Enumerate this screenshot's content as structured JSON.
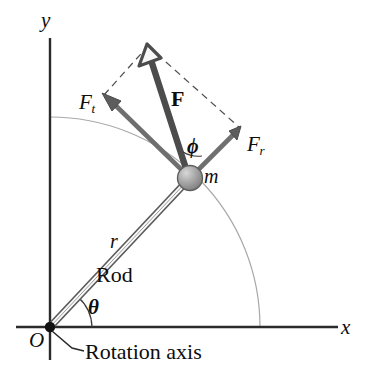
{
  "figure": {
    "background_color": "#ffffff",
    "width": 368,
    "height": 370
  },
  "axes": {
    "x_label": "x",
    "y_label": "y",
    "origin_label": "O",
    "axis_color": "#2b2b2b",
    "origin": {
      "x": 50,
      "y": 327
    },
    "x_end": {
      "x": 338,
      "y": 327
    },
    "y_top": {
      "x": 50,
      "y": 38
    }
  },
  "rod": {
    "label": "Rod",
    "length_label": "r",
    "angle_label": "θ",
    "color": "#4a4a4a",
    "start": {
      "x": 50,
      "y": 327
    },
    "end": {
      "x": 190,
      "y": 178
    }
  },
  "mass": {
    "label": "m",
    "center": {
      "x": 190,
      "y": 178
    },
    "radius": 12,
    "fill_color": "#9a9a9a"
  },
  "arc_path": {
    "color": "#9e9e9e",
    "radius": 210,
    "description": "circular path of the particle"
  },
  "vectors": [
    {
      "name": "F",
      "label": "F",
      "bold": true,
      "color": "#4a4a4a",
      "tail": {
        "x": 190,
        "y": 178
      },
      "tip": {
        "x": 148,
        "y": 46
      }
    },
    {
      "name": "F_t",
      "label": "F",
      "subscript": "t",
      "color": "#6e6e6e",
      "tail": {
        "x": 190,
        "y": 178
      },
      "tip": {
        "x": 104,
        "y": 95
      }
    },
    {
      "name": "F_r",
      "label": "F",
      "subscript": "r",
      "color": "#6e6e6e",
      "tail": {
        "x": 190,
        "y": 178
      },
      "tip": {
        "x": 240,
        "y": 128
      }
    }
  ],
  "angles": [
    {
      "name": "theta",
      "label": "θ",
      "description": "angle of rod from x-axis"
    },
    {
      "name": "phi",
      "label": "ϕ",
      "description": "angle between rod and force F"
    }
  ],
  "parallelogram": {
    "style": "dashed",
    "color": "#555555",
    "corners": [
      {
        "x": 190,
        "y": 178
      },
      {
        "x": 104,
        "y": 95
      },
      {
        "x": 148,
        "y": 46
      },
      {
        "x": 240,
        "y": 128
      }
    ]
  },
  "annotations": [
    {
      "name": "rotation-axis",
      "text": "Rotation axis",
      "leader_from": {
        "x": 52,
        "y": 330
      },
      "leader_to": {
        "x": 82,
        "y": 352
      }
    }
  ]
}
